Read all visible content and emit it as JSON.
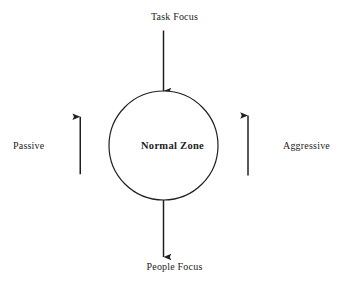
{
  "diagram": {
    "type": "radial-axis-diagram",
    "background_color": "#ffffff",
    "line_color": "#231f20",
    "text_color": "#1d1d1d",
    "center": {
      "shape": "circle",
      "label": "Normal Zone",
      "emphasis": "bold"
    },
    "axes": [
      {
        "id": "top",
        "label": "Task Focus",
        "direction": "up",
        "arrow": "single-ended-outward"
      },
      {
        "id": "right",
        "label": "Aggressive",
        "direction": "right",
        "arrow": "single-ended-outward"
      },
      {
        "id": "bottom",
        "label": "People Focus",
        "direction": "down",
        "arrow": "single-ended-outward"
      },
      {
        "id": "left",
        "label": "Passive",
        "direction": "left",
        "arrow": "single-ended-outward"
      }
    ]
  }
}
